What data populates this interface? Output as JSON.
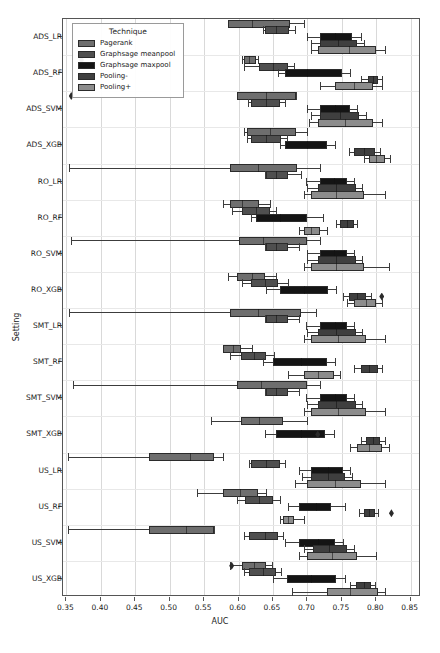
{
  "chart_data": {
    "type": "box",
    "title": "",
    "xlabel": "AUC",
    "ylabel": "Setting",
    "xlim": [
      0.345,
      0.865
    ],
    "xticks": [
      0.35,
      0.4,
      0.45,
      0.5,
      0.55,
      0.6,
      0.65,
      0.7,
      0.75,
      0.8,
      0.85
    ],
    "xticklabels": [
      "0.35",
      "0.40",
      "0.45",
      "0.50",
      "0.55",
      "0.60",
      "0.65",
      "0.70",
      "0.75",
      "0.80",
      "0.85"
    ],
    "grid": "vertical",
    "legend": {
      "title": "Technique",
      "position": "upper-left-inside",
      "entries": [
        {
          "label": "Pagerank",
          "color": "#6e6e6e"
        },
        {
          "label": "Graphsage meanpool",
          "color": "#4f4f4f"
        },
        {
          "label": "Graphsage maxpool",
          "color": "#141414"
        },
        {
          "label": "Pooling-",
          "color": "#3f3f3f"
        },
        {
          "label": "Pooling+",
          "color": "#8c8c8c"
        }
      ]
    },
    "categories": [
      "ADS_LR",
      "ADS_RF",
      "ADS_SVM",
      "ADS_XGB",
      "RO_LR",
      "RO_RF",
      "RO_SVM",
      "RO_XGB",
      "SMT_LR",
      "SMT_RF",
      "SMT_SVM",
      "SMT_XGB",
      "US_LR",
      "US_RF",
      "US_SVM",
      "US_XGB"
    ],
    "series": [
      {
        "name": "Pagerank",
        "boxes": [
          {
            "category": "ADS_LR",
            "whislo": 0.585,
            "q1": 0.585,
            "med": 0.62,
            "q3": 0.675,
            "whishi": 0.695,
            "fliers": []
          },
          {
            "category": "ADS_RF",
            "whislo": 0.605,
            "q1": 0.608,
            "med": 0.615,
            "q3": 0.625,
            "whishi": 0.628,
            "fliers": [
              0.372
            ]
          },
          {
            "category": "ADS_SVM",
            "whislo": 0.598,
            "q1": 0.598,
            "med": 0.64,
            "q3": 0.683,
            "whishi": 0.683,
            "fliers": [
              0.357
            ]
          },
          {
            "category": "ADS_XGB",
            "whislo": 0.608,
            "q1": 0.612,
            "med": 0.645,
            "q3": 0.683,
            "whishi": 0.7,
            "fliers": []
          },
          {
            "category": "RO_LR",
            "whislo": 0.353,
            "q1": 0.588,
            "med": 0.628,
            "q3": 0.685,
            "whishi": 0.718,
            "fliers": []
          },
          {
            "category": "RO_RF",
            "whislo": 0.578,
            "q1": 0.588,
            "med": 0.605,
            "q3": 0.63,
            "whishi": 0.645,
            "fliers": []
          },
          {
            "category": "RO_SVM",
            "whislo": 0.357,
            "q1": 0.6,
            "med": 0.635,
            "q3": 0.7,
            "whishi": 0.718,
            "fliers": []
          },
          {
            "category": "RO_XGB",
            "whislo": 0.585,
            "q1": 0.598,
            "med": 0.62,
            "q3": 0.638,
            "whishi": 0.655,
            "fliers": []
          },
          {
            "category": "SMT_LR",
            "whislo": 0.353,
            "q1": 0.588,
            "med": 0.628,
            "q3": 0.69,
            "whishi": 0.713,
            "fliers": []
          },
          {
            "category": "SMT_RF",
            "whislo": 0.578,
            "q1": 0.578,
            "med": 0.592,
            "q3": 0.603,
            "whishi": 0.62,
            "fliers": []
          },
          {
            "category": "SMT_SVM",
            "whislo": 0.36,
            "q1": 0.598,
            "med": 0.633,
            "q3": 0.7,
            "whishi": 0.718,
            "fliers": []
          },
          {
            "category": "SMT_XGB",
            "whislo": 0.56,
            "q1": 0.603,
            "med": 0.63,
            "q3": 0.665,
            "whishi": 0.7,
            "fliers": []
          },
          {
            "category": "US_LR",
            "whislo": 0.352,
            "q1": 0.47,
            "med": 0.53,
            "q3": 0.565,
            "whishi": 0.578,
            "fliers": []
          },
          {
            "category": "US_RF",
            "whislo": 0.54,
            "q1": 0.578,
            "med": 0.602,
            "q3": 0.628,
            "whishi": 0.64,
            "fliers": []
          },
          {
            "category": "US_SVM",
            "whislo": 0.352,
            "q1": 0.47,
            "med": 0.523,
            "q3": 0.565,
            "whishi": 0.565,
            "fliers": []
          },
          {
            "category": "US_XGB",
            "whislo": 0.588,
            "q1": 0.605,
            "med": 0.622,
            "q3": 0.64,
            "whishi": 0.648,
            "fliers": [
              0.59
            ]
          }
        ]
      },
      {
        "name": "Graphsage meanpool",
        "boxes": [
          {
            "category": "ADS_LR",
            "whislo": 0.635,
            "q1": 0.638,
            "med": 0.655,
            "q3": 0.673,
            "whishi": 0.682,
            "fliers": []
          },
          {
            "category": "ADS_RF",
            "whislo": 0.608,
            "q1": 0.63,
            "med": 0.65,
            "q3": 0.672,
            "whishi": 0.68,
            "fliers": []
          },
          {
            "category": "ADS_SVM",
            "whislo": 0.613,
            "q1": 0.618,
            "med": 0.64,
            "q3": 0.66,
            "whishi": 0.668,
            "fliers": []
          },
          {
            "category": "ADS_XGB",
            "whislo": 0.612,
            "q1": 0.618,
            "med": 0.64,
            "q3": 0.662,
            "whishi": 0.67,
            "fliers": []
          },
          {
            "category": "RO_LR",
            "whislo": 0.638,
            "q1": 0.64,
            "med": 0.655,
            "q3": 0.672,
            "whishi": 0.69,
            "fliers": []
          },
          {
            "category": "RO_RF",
            "whislo": 0.59,
            "q1": 0.605,
            "med": 0.625,
            "q3": 0.645,
            "whishi": 0.655,
            "fliers": []
          },
          {
            "category": "RO_SVM",
            "whislo": 0.638,
            "q1": 0.64,
            "med": 0.655,
            "q3": 0.672,
            "whishi": 0.688,
            "fliers": []
          },
          {
            "category": "RO_XGB",
            "whislo": 0.605,
            "q1": 0.618,
            "med": 0.638,
            "q3": 0.658,
            "whishi": 0.672,
            "fliers": []
          },
          {
            "category": "SMT_LR",
            "whislo": 0.638,
            "q1": 0.64,
            "med": 0.655,
            "q3": 0.672,
            "whishi": 0.688,
            "fliers": []
          },
          {
            "category": "SMT_RF",
            "whislo": 0.588,
            "q1": 0.603,
            "med": 0.622,
            "q3": 0.64,
            "whishi": 0.652,
            "fliers": []
          },
          {
            "category": "SMT_SVM",
            "whislo": 0.638,
            "q1": 0.64,
            "med": 0.655,
            "q3": 0.672,
            "whishi": 0.688,
            "fliers": []
          },
          {
            "category": "US_LR",
            "whislo": 0.615,
            "q1": 0.618,
            "med": 0.64,
            "q3": 0.66,
            "whishi": 0.668,
            "fliers": []
          },
          {
            "category": "US_LR",
            "whislo": 0.615,
            "q1": 0.618,
            "med": 0.64,
            "q3": 0.66,
            "whishi": 0.668,
            "fliers": []
          },
          {
            "category": "US_RF",
            "whislo": 0.598,
            "q1": 0.61,
            "med": 0.63,
            "q3": 0.65,
            "whishi": 0.66,
            "fliers": []
          },
          {
            "category": "US_SVM",
            "whislo": 0.608,
            "q1": 0.615,
            "med": 0.638,
            "q3": 0.658,
            "whishi": 0.665,
            "fliers": []
          },
          {
            "category": "US_XGB",
            "whislo": 0.608,
            "q1": 0.615,
            "med": 0.635,
            "q3": 0.655,
            "whishi": 0.662,
            "fliers": []
          }
        ]
      },
      {
        "name": "Graphsage maxpool",
        "boxes": [
          {
            "category": "ADS_LR",
            "whislo": 0.7,
            "q1": 0.718,
            "med": 0.74,
            "q3": 0.765,
            "whishi": 0.778,
            "fliers": []
          },
          {
            "category": "ADS_RF",
            "whislo": 0.658,
            "q1": 0.668,
            "med": 0.7,
            "q3": 0.75,
            "whishi": 0.762,
            "fliers": []
          },
          {
            "category": "ADS_SVM",
            "whislo": 0.7,
            "q1": 0.718,
            "med": 0.74,
            "q3": 0.762,
            "whishi": 0.772,
            "fliers": []
          },
          {
            "category": "ADS_XGB",
            "whislo": 0.66,
            "q1": 0.668,
            "med": 0.7,
            "q3": 0.728,
            "whishi": 0.74,
            "fliers": []
          },
          {
            "category": "RO_LR",
            "whislo": 0.698,
            "q1": 0.718,
            "med": 0.738,
            "q3": 0.758,
            "whishi": 0.768,
            "fliers": []
          },
          {
            "category": "RO_RF",
            "whislo": 0.618,
            "q1": 0.625,
            "med": 0.66,
            "q3": 0.7,
            "whishi": 0.722,
            "fliers": []
          },
          {
            "category": "RO_SVM",
            "whislo": 0.7,
            "q1": 0.718,
            "med": 0.738,
            "q3": 0.758,
            "whishi": 0.768,
            "fliers": []
          },
          {
            "category": "RO_XGB",
            "whislo": 0.64,
            "q1": 0.66,
            "med": 0.695,
            "q3": 0.73,
            "whishi": 0.742,
            "fliers": []
          },
          {
            "category": "SMT_LR",
            "whislo": 0.698,
            "q1": 0.718,
            "med": 0.74,
            "q3": 0.758,
            "whishi": 0.768,
            "fliers": []
          },
          {
            "category": "SMT_RF",
            "whislo": 0.635,
            "q1": 0.65,
            "med": 0.69,
            "q3": 0.728,
            "whishi": 0.74,
            "fliers": []
          },
          {
            "category": "SMT_SVM",
            "whislo": 0.698,
            "q1": 0.718,
            "med": 0.74,
            "q3": 0.758,
            "whishi": 0.768,
            "fliers": []
          },
          {
            "category": "SMT_XGB",
            "whislo": 0.638,
            "q1": 0.655,
            "med": 0.69,
            "q3": 0.725,
            "whishi": 0.738,
            "fliers": [
              0.715
            ]
          },
          {
            "category": "US_LR",
            "whislo": 0.688,
            "q1": 0.705,
            "med": 0.73,
            "q3": 0.752,
            "whishi": 0.762,
            "fliers": []
          },
          {
            "category": "US_RF",
            "whislo": 0.672,
            "q1": 0.688,
            "med": 0.712,
            "q3": 0.735,
            "whishi": 0.755,
            "fliers": []
          },
          {
            "category": "US_SVM",
            "whislo": 0.668,
            "q1": 0.688,
            "med": 0.715,
            "q3": 0.74,
            "whishi": 0.752,
            "fliers": []
          },
          {
            "category": "US_XGB",
            "whislo": 0.65,
            "q1": 0.67,
            "med": 0.705,
            "q3": 0.742,
            "whishi": 0.755,
            "fliers": []
          }
        ]
      },
      {
        "name": "Pooling-",
        "boxes": [
          {
            "category": "ADS_LR",
            "whislo": 0.705,
            "q1": 0.718,
            "med": 0.745,
            "q3": 0.772,
            "whishi": 0.782,
            "fliers": []
          },
          {
            "category": "ADS_RF",
            "whislo": 0.778,
            "q1": 0.788,
            "med": 0.795,
            "q3": 0.802,
            "whishi": 0.808,
            "fliers": []
          },
          {
            "category": "ADS_SVM",
            "whislo": 0.705,
            "q1": 0.718,
            "med": 0.748,
            "q3": 0.775,
            "whishi": 0.785,
            "fliers": []
          },
          {
            "category": "ADS_XGB",
            "whislo": 0.76,
            "q1": 0.768,
            "med": 0.782,
            "q3": 0.798,
            "whishi": 0.805,
            "fliers": []
          },
          {
            "category": "RO_LR",
            "whislo": 0.7,
            "q1": 0.715,
            "med": 0.742,
            "q3": 0.77,
            "whishi": 0.78,
            "fliers": []
          },
          {
            "category": "RO_RF",
            "whislo": 0.742,
            "q1": 0.748,
            "med": 0.758,
            "q3": 0.768,
            "whishi": 0.772,
            "fliers": []
          },
          {
            "category": "RO_SVM",
            "whislo": 0.7,
            "q1": 0.715,
            "med": 0.742,
            "q3": 0.77,
            "whishi": 0.78,
            "fliers": []
          },
          {
            "category": "RO_XGB",
            "whislo": 0.752,
            "q1": 0.76,
            "med": 0.772,
            "q3": 0.785,
            "whishi": 0.792,
            "fliers": [
              0.808
            ]
          },
          {
            "category": "SMT_LR",
            "whislo": 0.7,
            "q1": 0.715,
            "med": 0.742,
            "q3": 0.77,
            "whishi": 0.78,
            "fliers": []
          },
          {
            "category": "SMT_RF",
            "whislo": 0.768,
            "q1": 0.778,
            "med": 0.79,
            "q3": 0.802,
            "whishi": 0.808,
            "fliers": []
          },
          {
            "category": "SMT_SVM",
            "whislo": 0.7,
            "q1": 0.715,
            "med": 0.742,
            "q3": 0.77,
            "whishi": 0.78,
            "fliers": []
          },
          {
            "category": "SMT_XGB",
            "whislo": 0.778,
            "q1": 0.785,
            "med": 0.795,
            "q3": 0.805,
            "whishi": 0.812,
            "fliers": []
          },
          {
            "category": "US_LR",
            "whislo": 0.692,
            "q1": 0.705,
            "med": 0.73,
            "q3": 0.755,
            "whishi": 0.765,
            "fliers": []
          },
          {
            "category": "US_RF",
            "whislo": 0.775,
            "q1": 0.782,
            "med": 0.79,
            "q3": 0.798,
            "whishi": 0.802,
            "fliers": [
              0.822
            ]
          },
          {
            "category": "US_SVM",
            "whislo": 0.695,
            "q1": 0.708,
            "med": 0.732,
            "q3": 0.758,
            "whishi": 0.768,
            "fliers": []
          },
          {
            "category": "US_XGB",
            "whislo": 0.762,
            "q1": 0.77,
            "med": 0.782,
            "q3": 0.792,
            "whishi": 0.798,
            "fliers": []
          }
        ]
      },
      {
        "name": "Pooling+",
        "boxes": [
          {
            "category": "ADS_LR",
            "whislo": 0.705,
            "q1": 0.715,
            "med": 0.76,
            "q3": 0.8,
            "whishi": 0.812,
            "fliers": []
          },
          {
            "category": "ADS_RF",
            "whislo": 0.718,
            "q1": 0.74,
            "med": 0.768,
            "q3": 0.795,
            "whishi": 0.808,
            "fliers": []
          },
          {
            "category": "ADS_SVM",
            "whislo": 0.702,
            "q1": 0.715,
            "med": 0.755,
            "q3": 0.795,
            "whishi": 0.808,
            "fliers": []
          },
          {
            "category": "ADS_XGB",
            "whislo": 0.782,
            "q1": 0.79,
            "med": 0.8,
            "q3": 0.812,
            "whishi": 0.82,
            "fliers": []
          },
          {
            "category": "RO_LR",
            "whislo": 0.695,
            "q1": 0.705,
            "med": 0.742,
            "q3": 0.782,
            "whishi": 0.812,
            "fliers": []
          },
          {
            "category": "RO_RF",
            "whislo": 0.688,
            "q1": 0.695,
            "med": 0.705,
            "q3": 0.718,
            "whishi": 0.728,
            "fliers": []
          },
          {
            "category": "RO_SVM",
            "whislo": 0.695,
            "q1": 0.705,
            "med": 0.742,
            "q3": 0.782,
            "whishi": 0.818,
            "fliers": []
          },
          {
            "category": "RO_XGB",
            "whislo": 0.758,
            "q1": 0.768,
            "med": 0.785,
            "q3": 0.8,
            "whishi": 0.808,
            "fliers": []
          },
          {
            "category": "SMT_LR",
            "whislo": 0.695,
            "q1": 0.705,
            "med": 0.745,
            "q3": 0.785,
            "whishi": 0.812,
            "fliers": []
          },
          {
            "category": "SMT_RF",
            "whislo": 0.672,
            "q1": 0.695,
            "med": 0.715,
            "q3": 0.738,
            "whishi": 0.748,
            "fliers": []
          },
          {
            "category": "SMT_SVM",
            "whislo": 0.695,
            "q1": 0.705,
            "med": 0.745,
            "q3": 0.785,
            "whishi": 0.812,
            "fliers": []
          },
          {
            "category": "SMT_XGB",
            "whislo": 0.762,
            "q1": 0.772,
            "med": 0.79,
            "q3": 0.808,
            "whishi": 0.818,
            "fliers": []
          },
          {
            "category": "US_LR",
            "whislo": 0.682,
            "q1": 0.7,
            "med": 0.74,
            "q3": 0.778,
            "whishi": 0.812,
            "fliers": []
          },
          {
            "category": "US_RF",
            "whislo": 0.66,
            "q1": 0.665,
            "med": 0.672,
            "q3": 0.68,
            "whishi": 0.695,
            "fliers": []
          },
          {
            "category": "US_SVM",
            "whislo": 0.688,
            "q1": 0.7,
            "med": 0.735,
            "q3": 0.772,
            "whishi": 0.8,
            "fliers": []
          },
          {
            "category": "US_XGB",
            "whislo": 0.678,
            "q1": 0.728,
            "med": 0.762,
            "q3": 0.802,
            "whishi": 0.812,
            "fliers": []
          }
        ]
      }
    ]
  }
}
